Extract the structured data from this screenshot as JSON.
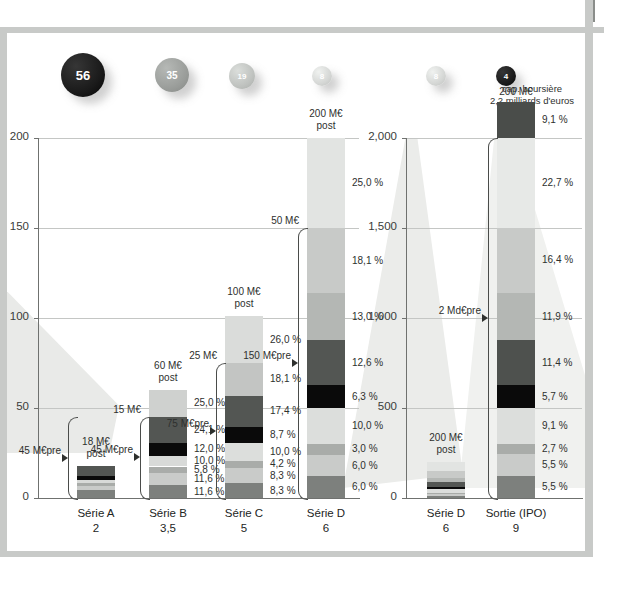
{
  "chart_data": {
    "type": "bar",
    "title": "",
    "caption": "Rentabilité moyenne des actions lors de leur premier jour de cotation",
    "subtitle": "",
    "xlabel": "",
    "ylabel": "",
    "grid": true,
    "legend_position": "none",
    "panels": [
      {
        "id": "panel-left",
        "ylim": [
          0,
          200
        ],
        "yticks": [
          "0",
          "50",
          "100",
          "150",
          "200"
        ],
        "ytick_values": [
          0,
          50,
          100,
          150,
          200
        ],
        "categories": [
          "Série A",
          "Série B",
          "Série C",
          "Série D"
        ],
        "category_values": [
          "2",
          "3,5",
          "5",
          "6"
        ],
        "bars": [
          {
            "name": "Série A",
            "total": 18,
            "post_label": "18 M€",
            "post_sub": "post",
            "pre_label": "45 M€",
            "pre_sub": "pre",
            "pre_value": 45,
            "bubble": "56",
            "segments": [
              {
                "pct": "",
                "value": 4.5,
                "color": "#7d807d"
              },
              {
                "pct": "",
                "value": 2.2,
                "color": "#c9cbc9"
              },
              {
                "pct": "",
                "value": 1.6,
                "color": "#a9aca9"
              },
              {
                "pct": "",
                "value": 1.9,
                "color": "#d8dad8"
              },
              {
                "pct": "",
                "value": 2.2,
                "color": "#0a0a0a"
              },
              {
                "pct": "",
                "value": 5.6,
                "color": "#535653"
              }
            ]
          },
          {
            "name": "Série B",
            "total": 60,
            "post_label": "60 M€",
            "post_sub": "post",
            "mid_label": "15 M€",
            "pre_label": "45 M€",
            "pre_sub": "pre",
            "bubble": "35",
            "segments": [
              {
                "pct": "11,6 %",
                "value": 7.0,
                "color": "#7d807d"
              },
              {
                "pct": "11,6 %",
                "value": 7.0,
                "color": "#c9cbc9"
              },
              {
                "pct": "5,8 %",
                "value": 3.5,
                "color": "#a9aca9"
              },
              {
                "pct": "10,0 %",
                "value": 6.0,
                "color": "#d8dad8"
              },
              {
                "pct": "12,0 %",
                "value": 7.2,
                "color": "#0a0a0a"
              },
              {
                "pct": "24,1 %",
                "value": 14.5,
                "color": "#535653"
              },
              {
                "pct": "25,0 %",
                "value": 15.0,
                "color": "#cfd1cf"
              }
            ]
          },
          {
            "name": "Série C",
            "total": 100,
            "post_label": "100 M€",
            "post_sub": "post",
            "mid_label": "25 M€",
            "pre_label": "75 M€",
            "pre_sub": "pre",
            "bubble": "19",
            "segments": [
              {
                "pct": "8,3 %",
                "value": 8.3,
                "color": "#7d807d"
              },
              {
                "pct": "8,3 %",
                "value": 8.3,
                "color": "#c9cbc9"
              },
              {
                "pct": "4,2 %",
                "value": 4.2,
                "color": "#a9aca9"
              },
              {
                "pct": "10,0 %",
                "value": 10.0,
                "color": "#dcdedc"
              },
              {
                "pct": "8,7 %",
                "value": 8.7,
                "color": "#0a0a0a"
              },
              {
                "pct": "17,4 %",
                "value": 17.4,
                "color": "#535653"
              },
              {
                "pct": "18,1 %",
                "value": 18.1,
                "color": "#c3c5c3"
              },
              {
                "pct": "26,0 %",
                "value": 26.0,
                "color": "#dadcda"
              }
            ]
          },
          {
            "name": "Série D",
            "total": 200,
            "post_label": "200 M€",
            "post_sub": "post",
            "mid_label": "50 M€",
            "pre_label": "150 M€",
            "pre_sub": "pre",
            "bubble": "8",
            "segments": [
              {
                "pct": "6,0 %",
                "value": 12.0,
                "color": "#7d807d"
              },
              {
                "pct": "6,0 %",
                "value": 12.0,
                "color": "#c9cbc9"
              },
              {
                "pct": "3,0 %",
                "value": 6.0,
                "color": "#a9aca9"
              },
              {
                "pct": "10,0 %",
                "value": 20.0,
                "color": "#dcdedc"
              },
              {
                "pct": "6,3 %",
                "value": 12.6,
                "color": "#0a0a0a"
              },
              {
                "pct": "12,6 %",
                "value": 25.2,
                "color": "#535653"
              },
              {
                "pct": "13,0 %",
                "value": 26.0,
                "color": "#b4b7b4"
              },
              {
                "pct": "18,1 %",
                "value": 36.2,
                "color": "#c8cac8"
              },
              {
                "pct": "25,0 %",
                "value": 50.0,
                "color": "#e2e4e2"
              }
            ]
          }
        ]
      },
      {
        "id": "panel-right",
        "ylim": [
          0,
          2000
        ],
        "yticks": [
          "0",
          "500",
          "1,000",
          "1,500",
          "2,000"
        ],
        "ytick_values": [
          0,
          500,
          1000,
          1500,
          2000
        ],
        "categories": [
          "Série D",
          "Sortie (IPO)"
        ],
        "category_values": [
          "6",
          "9"
        ],
        "bars": [
          {
            "name": "Série D",
            "total": 200,
            "post_label": "200 M€",
            "post_sub": "post",
            "bubble": "8",
            "segments": [
              {
                "pct": "",
                "value": 12.0,
                "color": "#7d807d"
              },
              {
                "pct": "",
                "value": 12.0,
                "color": "#c9cbc9"
              },
              {
                "pct": "",
                "value": 6.0,
                "color": "#a9aca9"
              },
              {
                "pct": "",
                "value": 20.0,
                "color": "#dcdedc"
              },
              {
                "pct": "",
                "value": 12.6,
                "color": "#0a0a0a"
              },
              {
                "pct": "",
                "value": 25.2,
                "color": "#535653"
              },
              {
                "pct": "",
                "value": 26.0,
                "color": "#b4b7b4"
              },
              {
                "pct": "",
                "value": 36.2,
                "color": "#c8cac8"
              },
              {
                "pct": "",
                "value": 50.0,
                "color": "#e2e4e2"
              }
            ]
          },
          {
            "name": "Sortie (IPO)",
            "total": 2200,
            "post_label": "200 M€",
            "post_sub": "",
            "pre_label": "2 Md€",
            "pre_sub": "pre",
            "bubble": "4",
            "header_note": "cap. boursière",
            "header_note_sub": "2,2 milliards d'euros",
            "segments": [
              {
                "pct": "5,5 %",
                "value": 121,
                "color": "#7d807d"
              },
              {
                "pct": "5,5 %",
                "value": 121,
                "color": "#c9cbc9"
              },
              {
                "pct": "2,7 %",
                "value": 59,
                "color": "#a9aca9"
              },
              {
                "pct": "9,1 %",
                "value": 200,
                "color": "#dcdedc"
              },
              {
                "pct": "5,7 %",
                "value": 125,
                "color": "#0a0a0a"
              },
              {
                "pct": "11,4 %",
                "value": 251,
                "color": "#4e514e"
              },
              {
                "pct": "11,9 %",
                "value": 262,
                "color": "#b4b7b4"
              },
              {
                "pct": "16,4 %",
                "value": 361,
                "color": "#c8cac8"
              },
              {
                "pct": "22,7 %",
                "value": 499,
                "color": "#e7e9e7"
              },
              {
                "pct": "9,1 %",
                "value": 200,
                "color": "#4a4d4a"
              }
            ]
          }
        ]
      }
    ],
    "bubbles": [
      {
        "label": "56",
        "color": "#1a1a1a"
      },
      {
        "label": "35",
        "color": "#9a9d9a"
      },
      {
        "label": "19",
        "color": "#bfc2bf"
      },
      {
        "label": "8",
        "color": "#d4d6d4"
      },
      {
        "label": "8",
        "color": "#d4d6d4"
      },
      {
        "label": "4",
        "color": "#1a1a1a"
      }
    ]
  },
  "annotations": {
    "ipo_header_line1": "cap. boursière",
    "ipo_header_line2": "2,2 milliards d'euros"
  }
}
